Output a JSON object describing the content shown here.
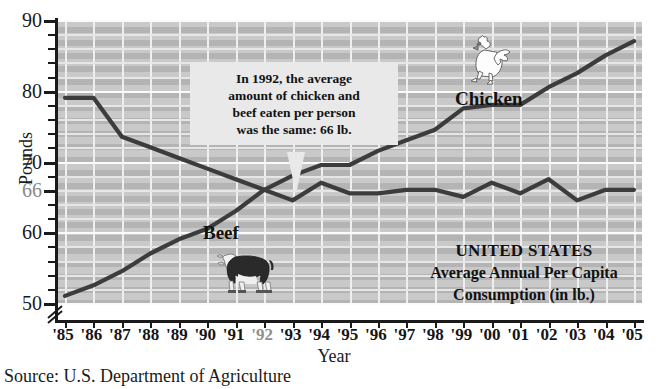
{
  "chart_data": {
    "type": "line",
    "title": "UNITED STATES Average Annual Per Capita Consumption (in lb.)",
    "xlabel": "Year",
    "ylabel": "Pounds",
    "ylim": [
      50,
      90
    ],
    "yticks": [
      50,
      60,
      66,
      70,
      80,
      90
    ],
    "ytick_labels": [
      "50",
      "60",
      "66",
      "70",
      "80",
      "90"
    ],
    "axis_break": true,
    "grid": true,
    "legend_position": "inline-labels",
    "x": [
      "'85",
      "'86",
      "'87",
      "'88",
      "'89",
      "'90",
      "'91",
      "'92",
      "'93",
      "'94",
      "'95",
      "'96",
      "'97",
      "'98",
      "'99",
      "'00",
      "'01",
      "'02",
      "'03",
      "'04",
      "'05"
    ],
    "categories": [
      "'85",
      "'86",
      "'87",
      "'88",
      "'89",
      "'90",
      "'91",
      "'92",
      "'93",
      "'94",
      "'95",
      "'96",
      "'97",
      "'98",
      "'99",
      "'00",
      "'01",
      "'02",
      "'03",
      "'04",
      "'05"
    ],
    "series": [
      {
        "name": "Beef",
        "color": "#3c3c3c",
        "values": [
          79,
          79,
          73.5,
          72,
          70.5,
          69,
          67.5,
          66,
          64.5,
          67,
          65.5,
          65.5,
          66,
          66,
          65,
          67,
          65.5,
          67.5,
          64.5,
          66,
          66
        ]
      },
      {
        "name": "Chicken",
        "color": "#3c3c3c",
        "values": [
          51,
          52.5,
          54.5,
          57,
          59,
          60.5,
          63,
          66,
          68,
          69.5,
          69.5,
          71.5,
          73,
          74.5,
          77.5,
          78,
          78,
          80.5,
          82.5,
          85,
          87
        ]
      }
    ],
    "annotations": [
      {
        "name": "crossover-callout",
        "text": "In 1992, the average amount of chicken and beef eaten per person was the same: 66 lb.",
        "lines": [
          "In 1992, the average",
          "amount of chicken and",
          "beef eaten per person",
          "was the same: 66 lb."
        ],
        "points_to_year": "'92",
        "points_to_value": 66
      }
    ]
  },
  "axis": {
    "y_title": "Pounds",
    "x_title": "Year",
    "y_labels": [
      "90",
      "80",
      "70",
      "66",
      "60",
      "50"
    ],
    "x_labels": [
      "'85",
      "'86",
      "'87",
      "'88",
      "'89",
      "'90",
      "'91",
      "'92",
      "'93",
      "'94",
      "'95",
      "'96",
      "'97",
      "'98",
      "'99",
      "'00",
      "'01",
      "'02",
      "'03",
      "'04",
      "'05"
    ]
  },
  "labels": {
    "chicken": "Chicken",
    "beef": "Beef"
  },
  "callout": {
    "line1": "In 1992, the average",
    "line2": "amount of chicken and",
    "line3": "beef eaten per person",
    "line4": "was the same: 66 lb."
  },
  "title_block": {
    "line1": "UNITED STATES",
    "line2": "Average Annual Per Capita",
    "line3": "Consumption (in lb.)"
  },
  "source": {
    "text": "Source: U.S. Department of Agriculture"
  },
  "icons": {
    "rooster": "rooster-illustration",
    "cow": "cow-illustration"
  },
  "colors": {
    "plot_background": "#b4b4b4",
    "band": "#c9c9c9",
    "gridline": "#f0f0f0",
    "line": "#3c3c3c",
    "axis": "#1a1a1a",
    "callout_background": "#e9e9e9",
    "highlight_label": "#8a8a8a"
  }
}
